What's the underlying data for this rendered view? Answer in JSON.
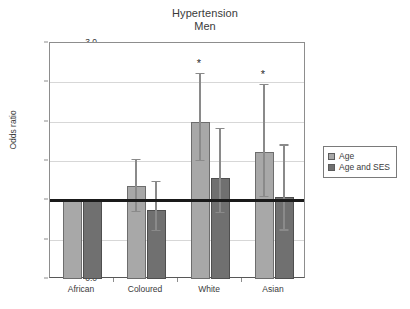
{
  "chart_data": {
    "type": "bar",
    "title": "Hypertension Men",
    "title_lines": [
      "Hypertension",
      "Men"
    ],
    "xlabel": "",
    "ylabel": "Odds ratio",
    "categories": [
      "African",
      "Coloured",
      "White",
      "Asian"
    ],
    "ylim": [
      0.0,
      3.0
    ],
    "yticks": [
      "0.0",
      "0.5",
      "1.0",
      "1.5",
      "2.0",
      "2.5",
      "3.0"
    ],
    "ytick_values": [
      0.0,
      0.5,
      1.0,
      1.5,
      2.0,
      2.5,
      3.0
    ],
    "grid": "horizontal",
    "legend_position": "right",
    "reference_line": 1.0,
    "series": [
      {
        "name": "Age",
        "color": "#a8a8a8",
        "values": [
          1.0,
          1.18,
          2.0,
          1.62
        ],
        "ci_low": [
          null,
          0.87,
          1.51,
          1.06
        ],
        "ci_high": [
          null,
          1.53,
          2.62,
          2.48
        ],
        "significant": [
          false,
          false,
          true,
          true
        ]
      },
      {
        "name": "Age and SES",
        "color": "#707070",
        "values": [
          1.0,
          0.88,
          1.29,
          1.04
        ],
        "ci_low": [
          null,
          0.62,
          0.85,
          0.63
        ],
        "ci_high": [
          null,
          1.25,
          1.92,
          1.71
        ],
        "significant": [
          false,
          false,
          false,
          false
        ]
      }
    ],
    "annotations": [
      {
        "text": "*",
        "category": "White",
        "series": "Age"
      },
      {
        "text": "*",
        "category": "Asian",
        "series": "Age"
      }
    ]
  },
  "legend": {
    "items": [
      {
        "label": "Age",
        "color": "#a8a8a8"
      },
      {
        "label": "Age and SES",
        "color": "#707070"
      }
    ]
  }
}
